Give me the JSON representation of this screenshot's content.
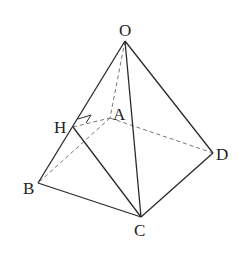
{
  "diagram": {
    "type": "geometry-figure",
    "colors": {
      "line": "#2a2a2a",
      "hidden_line": "#777777",
      "label": "#222222",
      "background": "#ffffff"
    },
    "points": {
      "O": {
        "label": "O",
        "x": 125,
        "y": 41
      },
      "A": {
        "label": "A",
        "x": 110,
        "y": 118
      },
      "H": {
        "label": "H",
        "x": 73,
        "y": 127
      },
      "B": {
        "label": "B",
        "x": 38,
        "y": 183
      },
      "C": {
        "label": "C",
        "x": 141,
        "y": 217
      },
      "D": {
        "label": "D",
        "x": 213,
        "y": 153
      }
    },
    "solid_edges": [
      "OB",
      "OC",
      "OD",
      "BC",
      "CD",
      "HC"
    ],
    "dashed_edges": [
      "OA",
      "AB",
      "AD",
      "HA"
    ],
    "right_angle_mark": {
      "at": "H",
      "between": [
        "HA",
        "HO"
      ]
    }
  }
}
